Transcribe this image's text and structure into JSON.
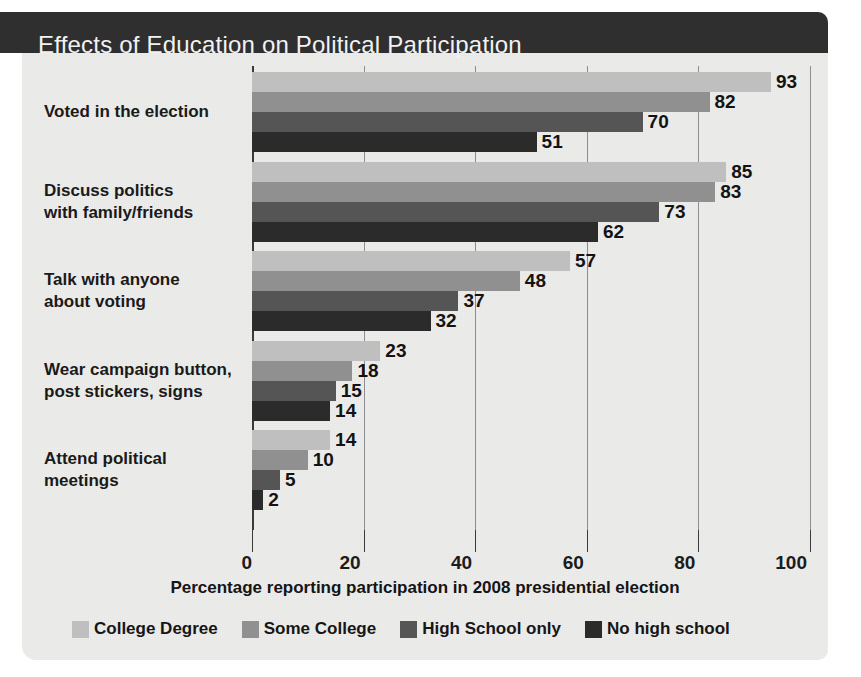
{
  "title": "Effects of Education on Political Participation",
  "colors": {
    "title_bar": "#2f2f30",
    "panel": "#ededec",
    "series": [
      "#bfbfbf",
      "#909090",
      "#555555",
      "#2b2b2b"
    ],
    "text": "#1a1a1a"
  },
  "axis": {
    "title": "Percentage reporting participation in 2008 presidential election",
    "ticks": [
      "0",
      "20",
      "40",
      "60",
      "80",
      "100"
    ],
    "min": 0,
    "max": 100
  },
  "legend": {
    "items": [
      {
        "label": "College Degree",
        "color": "#bfbfbf"
      },
      {
        "label": "Some College",
        "color": "#909090"
      },
      {
        "label": "High School only",
        "color": "#555555"
      },
      {
        "label": "No high school",
        "color": "#2b2b2b"
      }
    ]
  },
  "chart_data": {
    "type": "bar",
    "orientation": "horizontal",
    "title": "Effects of Education on Political Participation",
    "xlabel": "Percentage reporting participation in 2008 presidential election",
    "ylabel": "",
    "xlim": [
      0,
      100
    ],
    "xticks": [
      0,
      20,
      40,
      60,
      80,
      100
    ],
    "grid": true,
    "legend_position": "bottom",
    "categories": [
      "Voted in the election",
      "Discuss politics\nwith family/friends",
      "Talk with anyone\nabout voting",
      "Wear campaign button,\npost stickers, signs",
      "Attend political\nmeetings"
    ],
    "series": [
      {
        "name": "College Degree",
        "color": "#bfbfbf",
        "values": [
          93,
          85,
          57,
          23,
          14
        ]
      },
      {
        "name": "Some College",
        "color": "#909090",
        "values": [
          82,
          83,
          48,
          18,
          10
        ]
      },
      {
        "name": "High School only",
        "color": "#555555",
        "values": [
          70,
          73,
          37,
          15,
          5
        ]
      },
      {
        "name": "No high school",
        "color": "#2b2b2b",
        "values": [
          51,
          62,
          32,
          14,
          2
        ]
      }
    ]
  }
}
